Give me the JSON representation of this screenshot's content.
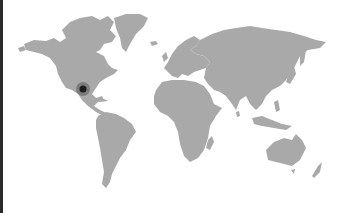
{
  "map": {
    "style": "grey world silhouette on white",
    "colors": {
      "background": "#ffffff",
      "land": "#a9a9a9",
      "edge_strip": "#2a2a2a",
      "marker_core": "#1e1e1e",
      "marker_halo": "#6e6e6e"
    },
    "marker": {
      "label": "location-marker",
      "region": "Southern United States (Texas / Gulf coast)",
      "x": 83,
      "y": 89
    },
    "regions": [
      "North America",
      "Greenland",
      "South America",
      "Europe",
      "Africa",
      "Asia",
      "Australia",
      "New Zealand"
    ]
  }
}
